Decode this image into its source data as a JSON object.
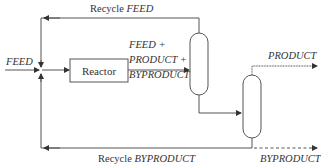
{
  "diagram": {
    "type": "process-flow",
    "labels": {
      "feed_input": "FEED",
      "recycle_feed_prefix": "Recycle",
      "recycle_feed_stream": "FEED",
      "reactor": "Reactor",
      "reactor_outlet_line1": "FEED +",
      "reactor_outlet_line2": "PRODUCT +",
      "reactor_outlet_line3": "BYPRODUCT",
      "product_outlet": "PRODUCT",
      "recycle_byproduct_prefix": "Recycle",
      "recycle_byproduct_stream": "BYPRODUCT",
      "byproduct_outlet": "BYPRODUCT"
    },
    "nodes": [
      {
        "id": "reactor",
        "label": "Reactor",
        "shape": "rectangle"
      },
      {
        "id": "column1",
        "label": "",
        "shape": "capsule-vertical"
      },
      {
        "id": "column2",
        "label": "",
        "shape": "capsule-vertical"
      }
    ],
    "edges": [
      {
        "from": "FEED (inlet)",
        "to": "mixing-junction",
        "label": "FEED"
      },
      {
        "from": "mixing-junction",
        "to": "reactor",
        "label": ""
      },
      {
        "from": "reactor",
        "to": "column1",
        "label": "FEED + PRODUCT + BYPRODUCT"
      },
      {
        "from": "column1 (top)",
        "to": "mixing-junction",
        "label": "Recycle FEED"
      },
      {
        "from": "column1 (bottom)",
        "to": "column2",
        "label": ""
      },
      {
        "from": "column2 (top)",
        "to": "PRODUCT (outlet)",
        "label": "PRODUCT"
      },
      {
        "from": "column2 (bottom)",
        "to": "mixing-junction",
        "label": "Recycle BYPRODUCT"
      },
      {
        "from": "column2 (bottom)",
        "to": "BYPRODUCT (outlet)",
        "label": "BYPRODUCT",
        "style": "dashed"
      }
    ],
    "colors": {
      "line": "#555555",
      "text": "#333333",
      "background": "#ffffff"
    }
  }
}
